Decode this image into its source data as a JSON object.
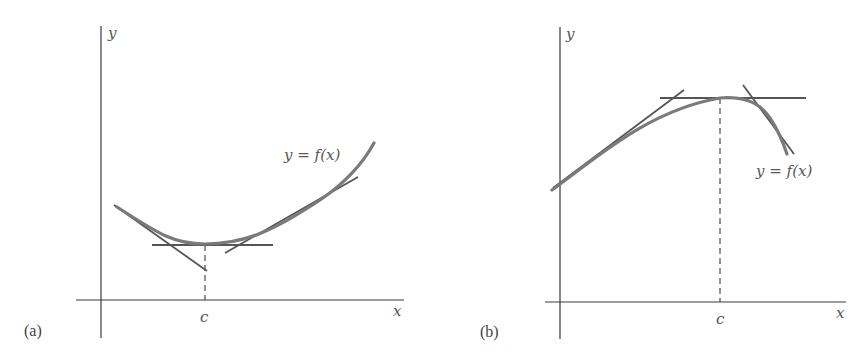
{
  "figure": {
    "panels": [
      {
        "id": "a",
        "label": "(a)",
        "x_axis_label": "x",
        "y_axis_label": "y",
        "curve_label": "y = f(x)",
        "tick_label": "c",
        "description": "convex curve with local minimum at x = c; horizontal tangent at minimum and tangents on each side"
      },
      {
        "id": "b",
        "label": "(b)",
        "x_axis_label": "x",
        "y_axis_label": "y",
        "curve_label": "y = f(x)",
        "tick_label": "c",
        "description": "concave curve with local maximum at x = c; horizontal tangent at maximum and tangents on each side"
      }
    ]
  },
  "colors": {
    "axis": "#3a3a3a",
    "curve": "#7a7a7a",
    "tangent": "#555555",
    "background": "#ffffff"
  }
}
